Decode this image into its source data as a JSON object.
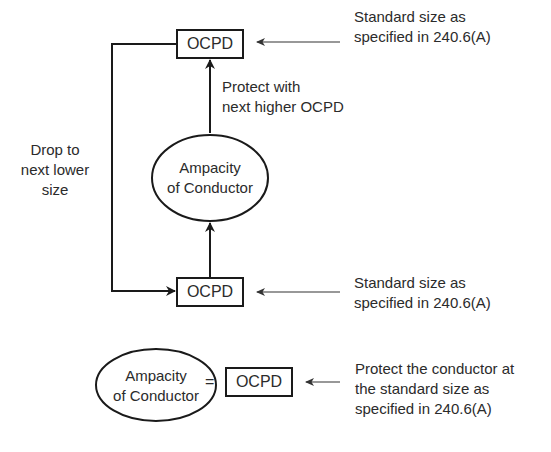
{
  "diagram": {
    "top": {
      "box_label": "OCPD",
      "note_line1": "Standard size as",
      "note_line2": "specified in 240.6(A)",
      "arrow_label_line1": "Protect with",
      "arrow_label_line2": "next higher OCPD"
    },
    "middle": {
      "ellipse_line1": "Ampacity",
      "ellipse_line2": "of Conductor",
      "side_label_line1": "Drop to",
      "side_label_line2": "next lower",
      "side_label_line3": "size"
    },
    "bottom": {
      "box_label": "OCPD",
      "note_line1": "Standard size as",
      "note_line2": "specified in 240.6(A)"
    },
    "equation": {
      "ellipse_line1": "Ampacity",
      "ellipse_line2": "of Conductor",
      "operator": "=",
      "box_label": "OCPD",
      "note_line1": "Protect the conductor at",
      "note_line2": "the standard size as",
      "note_line3": "specified in 240.6(A)"
    },
    "colors": {
      "stroke": "#1a1a1a",
      "text": "#2b2b2b",
      "background": "#ffffff"
    }
  }
}
